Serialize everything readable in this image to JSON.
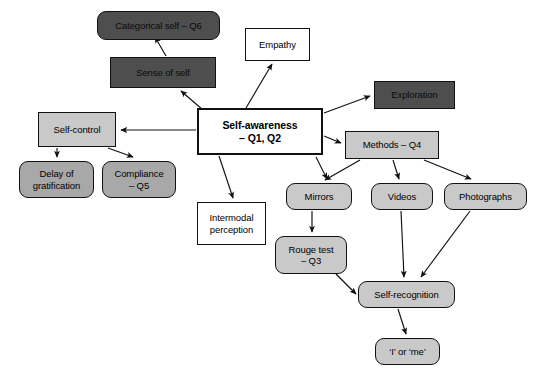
{
  "diagram": {
    "canvas": {
      "width": 541,
      "height": 379,
      "background": "#ffffff"
    },
    "palette": {
      "white": "#ffffff",
      "light_gray": "#c9c9c9",
      "mid_gray": "#a8a8a8",
      "dark_gray": "#4e4e4e",
      "stroke": "#111111"
    },
    "nodes": [
      {
        "id": "categorical_self",
        "label": "Categorical self – Q6",
        "fill": "dark",
        "shape": "rounded",
        "x": 97,
        "y": 11,
        "w": 123,
        "h": 29,
        "font_size": 9.5
      },
      {
        "id": "sense_of_self",
        "label": "Sense of self",
        "fill": "dark",
        "shape": "square",
        "x": 110,
        "y": 57,
        "w": 106,
        "h": 31,
        "font_size": 9.5
      },
      {
        "id": "empathy",
        "label": "Empathy",
        "fill": "white",
        "shape": "square",
        "x": 245,
        "y": 28,
        "w": 65,
        "h": 33,
        "font_size": 9.5
      },
      {
        "id": "exploration",
        "label": "Exploration",
        "fill": "dark",
        "shape": "square",
        "x": 374,
        "y": 81,
        "w": 81,
        "h": 28,
        "font_size": 9.5
      },
      {
        "id": "self_control",
        "label": "Self-control",
        "fill": "light",
        "shape": "square",
        "x": 38,
        "y": 112,
        "w": 78,
        "h": 35,
        "font_size": 9.5
      },
      {
        "id": "self_awareness",
        "label": "Self-awareness\n– Q1, Q2",
        "fill": "white",
        "shape": "square",
        "x": 197,
        "y": 108,
        "w": 126,
        "h": 47,
        "font_size": 10.5,
        "bold": true,
        "emphasis": true
      },
      {
        "id": "methods",
        "label": "Methods – Q4",
        "fill": "light",
        "shape": "square",
        "x": 345,
        "y": 131,
        "w": 94,
        "h": 28,
        "font_size": 9.5
      },
      {
        "id": "delay_of_gratification",
        "label": "Delay of\ngratification",
        "fill": "mid",
        "shape": "rounded",
        "x": 19,
        "y": 161,
        "w": 75,
        "h": 37,
        "font_size": 9.5
      },
      {
        "id": "compliance",
        "label": "Compliance\n– Q5",
        "fill": "mid",
        "shape": "rounded",
        "x": 102,
        "y": 161,
        "w": 74,
        "h": 37,
        "font_size": 9.5
      },
      {
        "id": "intermodal_perception",
        "label": "Intermodal\nperception",
        "fill": "white",
        "shape": "square",
        "x": 197,
        "y": 202,
        "w": 69,
        "h": 43,
        "font_size": 9.5
      },
      {
        "id": "mirrors",
        "label": "Mirrors",
        "fill": "light",
        "shape": "rounded",
        "x": 286,
        "y": 183,
        "w": 66,
        "h": 27,
        "font_size": 9.5
      },
      {
        "id": "videos",
        "label": "Videos",
        "fill": "light",
        "shape": "rounded",
        "x": 371,
        "y": 183,
        "w": 62,
        "h": 27,
        "font_size": 9.5
      },
      {
        "id": "photographs",
        "label": "Photographs",
        "fill": "light",
        "shape": "rounded",
        "x": 444,
        "y": 183,
        "w": 83,
        "h": 27,
        "font_size": 9.5
      },
      {
        "id": "rouge_test",
        "label": "Rouge test\n– Q3",
        "fill": "light",
        "shape": "rounded",
        "x": 275,
        "y": 236,
        "w": 72,
        "h": 38,
        "font_size": 9.5
      },
      {
        "id": "self_recognition",
        "label": "Self-recognition",
        "fill": "light",
        "shape": "rounded",
        "x": 358,
        "y": 281,
        "w": 97,
        "h": 27,
        "font_size": 9.5
      },
      {
        "id": "i_or_me",
        "label": "‘I’ or ‘me’",
        "fill": "light",
        "shape": "rounded",
        "x": 375,
        "y": 338,
        "w": 65,
        "h": 27,
        "font_size": 9.5
      }
    ],
    "edges": [
      {
        "id": "e-sense-to-categorical",
        "from": "sense_of_self",
        "to": "categorical_self",
        "path": "M 166 56 L 155 37"
      },
      {
        "id": "e-awareness-to-sense",
        "from": "self_awareness",
        "to": "sense_of_self",
        "path": "M 203 110 L 181 91"
      },
      {
        "id": "e-awareness-to-empathy",
        "from": "self_awareness",
        "to": "empathy",
        "path": "M 246 108 L 272 64"
      },
      {
        "id": "e-awareness-to-exploration",
        "from": "self_awareness",
        "to": "exploration",
        "path": "M 324 113 L 370 96"
      },
      {
        "id": "e-awareness-to-selfcontrol",
        "from": "self_awareness",
        "to": "self_control",
        "path": "M 196 130 L 121 130"
      },
      {
        "id": "e-awareness-to-methods",
        "from": "self_awareness",
        "to": "methods",
        "path": "M 324 136 L 341 143"
      },
      {
        "id": "e-awareness-to-intermodal",
        "from": "self_awareness",
        "to": "intermodal_perception",
        "path": "M 219 156 L 233 198"
      },
      {
        "id": "e-awareness-to-mirrors",
        "from": "self_awareness",
        "to": "mirrors",
        "path": "M 316 157 L 327 179"
      },
      {
        "id": "e-selfcontrol-to-delay",
        "from": "self_control",
        "to": "delay_of_gratification",
        "path": "M 57 148 L 57 157"
      },
      {
        "id": "e-selfcontrol-to-compliance",
        "from": "self_control",
        "to": "compliance",
        "path": "M 108 148 L 133 157"
      },
      {
        "id": "e-methods-to-mirrors",
        "from": "methods",
        "to": "mirrors",
        "path": "M 360 160 L 325 180"
      },
      {
        "id": "e-methods-to-videos",
        "from": "methods",
        "to": "videos",
        "path": "M 393 160 L 399 179"
      },
      {
        "id": "e-methods-to-photographs",
        "from": "methods",
        "to": "photographs",
        "path": "M 424 160 L 471 179"
      },
      {
        "id": "e-mirrors-to-rouge",
        "from": "mirrors",
        "to": "rouge_test",
        "path": "M 312 211 L 312 232"
      },
      {
        "id": "e-rouge-to-selfrecognition",
        "from": "rouge_test",
        "to": "self_recognition",
        "path": "M 336 274 L 356 294"
      },
      {
        "id": "e-videos-to-selfrecognition",
        "from": "videos",
        "to": "self_recognition",
        "path": "M 401 211 L 404 277"
      },
      {
        "id": "e-photographs-to-selfrecognition",
        "from": "photographs",
        "to": "self_recognition",
        "path": "M 470 211 L 421 277"
      },
      {
        "id": "e-selfrecognition-to-iorme",
        "from": "self_recognition",
        "to": "i_or_me",
        "path": "M 398 309 L 406 334"
      }
    ]
  }
}
